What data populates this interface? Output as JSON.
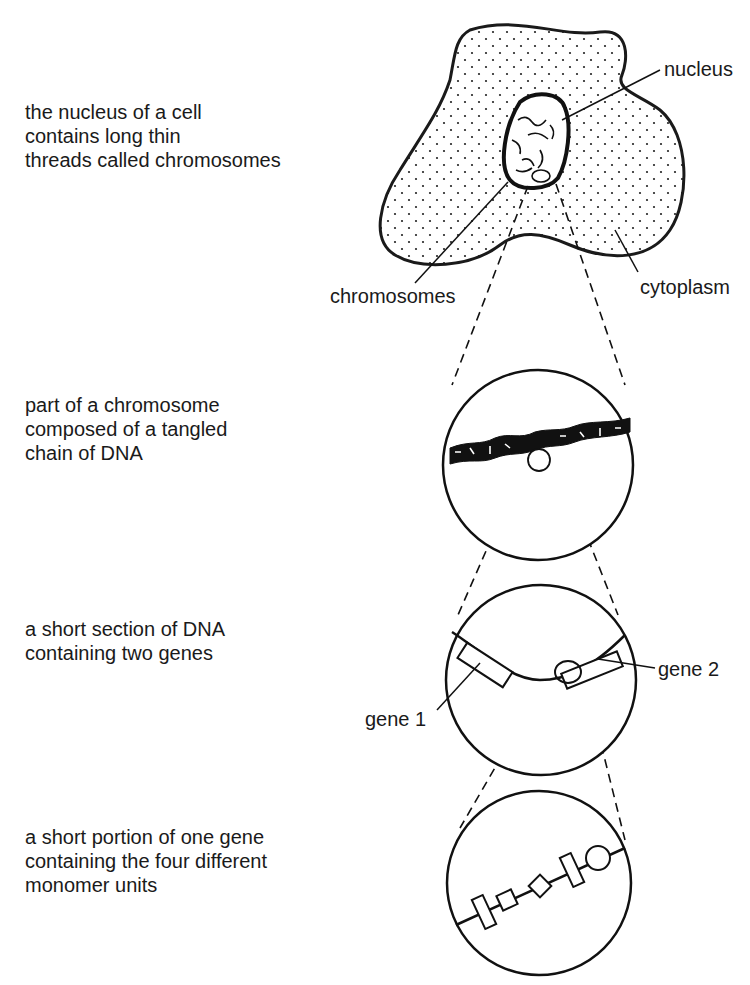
{
  "descriptions": [
    {
      "id": "cell",
      "text": "the nucleus of a cell\ncontains long thin\nthreads called chromosomes"
    },
    {
      "id": "chromosome",
      "text": "part of a chromosome\ncomposed of a tangled\nchain of DNA"
    },
    {
      "id": "dna",
      "text": "a short section of DNA\ncontaining two genes"
    },
    {
      "id": "gene",
      "text": "a short portion of one gene\ncontaining the four different\nmonomer units"
    }
  ],
  "labels": {
    "nucleus": "nucleus",
    "chromosomes": "chromosomes",
    "cytoplasm": "cytoplasm",
    "gene1": "gene 1",
    "gene2": "gene 2"
  },
  "colors": {
    "ink": "#1a1a1a",
    "background": "#ffffff"
  }
}
